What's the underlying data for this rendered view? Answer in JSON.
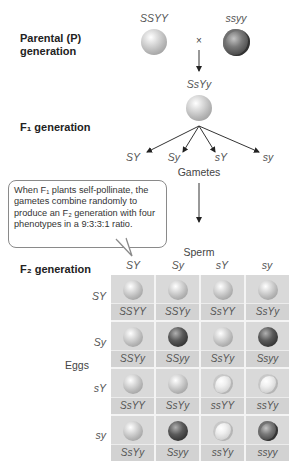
{
  "labels": {
    "parental": "Parental (P)",
    "parental_line2": "generation",
    "f1": "F₁ generation",
    "f2": "F₂ generation"
  },
  "parental": {
    "left_genotype": "SSYY",
    "right_genotype": "ssyy",
    "cross_symbol": "×",
    "left_phenotype": "yellow-round",
    "right_phenotype": "green-wrinkled"
  },
  "f1": {
    "genotype": "SsYy",
    "phenotype": "yellow-round"
  },
  "gametes": {
    "title": "Gametes",
    "items": [
      "SY",
      "Sy",
      "sY",
      "sy"
    ]
  },
  "callout": {
    "text": "When F₁ plants self-pollinate, the gametes combine randomly to produce an F₂ generation with four phenotypes in a 9:3:3:1 ratio."
  },
  "punnett": {
    "column_title": "Sperm",
    "row_title": "Eggs",
    "columns": [
      "SY",
      "Sy",
      "sY",
      "sy"
    ],
    "rows": [
      "SY",
      "Sy",
      "sY",
      "sy"
    ],
    "cells": [
      [
        {
          "g": "SSYY",
          "p": "yr"
        },
        {
          "g": "SSYy",
          "p": "yr"
        },
        {
          "g": "SsYY",
          "p": "yr"
        },
        {
          "g": "SsYy",
          "p": "yr"
        }
      ],
      [
        {
          "g": "SSYy",
          "p": "yr"
        },
        {
          "g": "SSyy",
          "p": "gr"
        },
        {
          "g": "SsYy",
          "p": "yr"
        },
        {
          "g": "Ssyy",
          "p": "gr"
        }
      ],
      [
        {
          "g": "SsYY",
          "p": "yr"
        },
        {
          "g": "SsYy",
          "p": "yr"
        },
        {
          "g": "ssYY",
          "p": "yw"
        },
        {
          "g": "ssYy",
          "p": "yw"
        }
      ],
      [
        {
          "g": "SsYy",
          "p": "yr"
        },
        {
          "g": "Ssyy",
          "p": "gr"
        },
        {
          "g": "ssYy",
          "p": "yw"
        },
        {
          "g": "ssyy",
          "p": "gw"
        }
      ]
    ],
    "phenotype_ratio": "9:3:3:1"
  },
  "colors": {
    "cell_bg": "#d9d9d9",
    "grid_line": "#f4f4f4",
    "text_gray": "#555555"
  }
}
